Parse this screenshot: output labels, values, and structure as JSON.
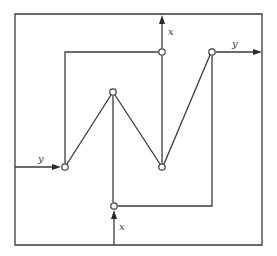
{
  "diagram": {
    "title": "",
    "colors": {
      "line": "#3a3a3a",
      "background": "#ffffff"
    },
    "labels": {
      "top_output": "x",
      "right_output": "y",
      "left_input": "y",
      "bottom_input": "x"
    },
    "nodes": [
      {
        "id": "n_left",
        "x": 65,
        "y": 167
      },
      {
        "id": "n_apex",
        "x": 113,
        "y": 92
      },
      {
        "id": "n_mid",
        "x": 162,
        "y": 167
      },
      {
        "id": "n_topx",
        "x": 162,
        "y": 52
      },
      {
        "id": "n_topright",
        "x": 212,
        "y": 52
      },
      {
        "id": "n_bottomx",
        "x": 114,
        "y": 206
      }
    ]
  }
}
